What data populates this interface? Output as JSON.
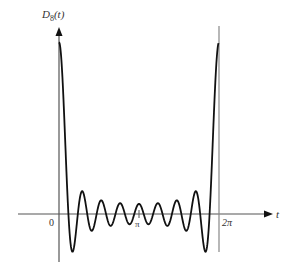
{
  "chart_data": {
    "type": "line",
    "title": "",
    "function": "D_8(t) = sin(17t/2) / sin(t/2)  (Dirichlet kernel, N = 8)",
    "xlabel": "t",
    "ylabel": "D8(t)",
    "ylabel_main": "D",
    "ylabel_sub": "8",
    "ylabel_arg": "(t)",
    "x_ticks": [
      {
        "value": 0,
        "label": "0"
      },
      {
        "value": 3.14159,
        "label": "π"
      },
      {
        "value": 6.28318,
        "label": "2π"
      }
    ],
    "xlim": [
      -1.3,
      6.8
    ],
    "ylim": [
      -4.8,
      17.8
    ],
    "grid": false,
    "legend": null,
    "reference_lines": [
      {
        "orientation": "vertical",
        "x": 6.28318,
        "label": "2π"
      }
    ],
    "peak_value": 17,
    "series": [
      {
        "name": "D8(t)",
        "x": [
          0,
          0.1,
          0.2,
          0.3,
          0.37,
          0.45,
          0.53,
          0.6,
          0.7,
          0.8,
          0.9,
          0.92,
          1.0,
          1.1,
          1.2,
          1.29,
          1.4,
          1.5,
          1.66,
          1.8,
          1.9,
          2.03,
          2.2,
          2.4,
          2.59,
          2.77,
          2.96,
          3.14,
          3.33,
          3.51,
          3.7,
          3.88,
          4.07,
          4.25,
          4.44,
          4.62,
          4.81,
          4.99,
          5.18,
          5.36,
          5.55,
          5.73,
          5.83,
          5.91,
          6.0,
          6.1,
          6.18,
          6.28
        ],
        "y": [
          17.0,
          15.0,
          9.6,
          3.0,
          0.0,
          -2.5,
          -3.6,
          -3.2,
          -1.6,
          0.6,
          2.1,
          2.2,
          1.8,
          0.1,
          -1.4,
          -1.5,
          -0.7,
          0.6,
          1.3,
          0.1,
          -0.9,
          -1.1,
          0.3,
          1.0,
          0.1,
          -1.0,
          0.2,
          1.0,
          0.2,
          -1.0,
          0.1,
          1.0,
          0.3,
          -1.1,
          -0.9,
          0.1,
          1.3,
          0.6,
          -0.7,
          -1.5,
          -1.4,
          0.1,
          1.8,
          2.2,
          -0.1,
          -3.2,
          -3.6,
          17.0
        ]
      }
    ]
  }
}
